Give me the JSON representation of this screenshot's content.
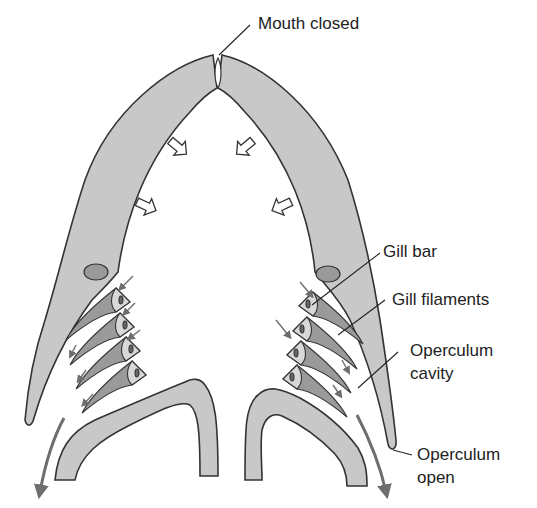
{
  "diagram": {
    "labels": {
      "mouth": "Mouth closed",
      "gill_bar": "Gill bar",
      "gill_filaments": "Gill filaments",
      "operculum_cavity_1": "Operculum",
      "operculum_cavity_2": "cavity",
      "operculum_open_1": "Operculum",
      "operculum_open_2": "open"
    },
    "colors": {
      "tissue_fill": "#c8c8c8",
      "tissue_dark": "#9a9a9a",
      "outline": "#333333",
      "flow_arrow": "#6e6e6e",
      "background": "#ffffff"
    },
    "elements": {
      "pressure_arrows": 4,
      "gill_arches_per_side": 4,
      "water_flow": "Water enters mouth, passes over gill filaments into operculum cavity, exits through open operculum"
    }
  }
}
